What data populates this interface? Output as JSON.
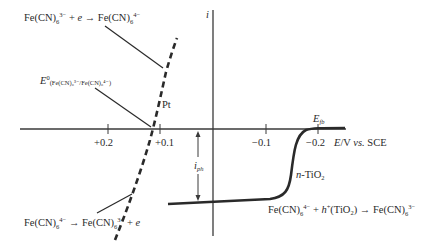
{
  "diagram": {
    "axes": {
      "y_label": "i",
      "x_label_italic": "E",
      "x_label_rest": "/V ",
      "x_label_vs": "vs.",
      "x_label_ref": " SCE",
      "ticks": [
        "+0.2",
        "+0.1",
        "−0.1",
        "−0.2"
      ],
      "flatband_label": "E",
      "flatband_sub": "fb"
    },
    "curves": {
      "pt": {
        "label": "Pt",
        "style": "dashed"
      },
      "tio2": {
        "label_italic": "n",
        "label_rest": "-TiO",
        "label_sub": "2",
        "style": "solid"
      }
    },
    "photocurrent": {
      "label": "i",
      "sub": "ph"
    },
    "annotations": {
      "reduction": {
        "lhs": "Fe(CN)",
        "lhs_sub": "6",
        "lhs_sup": "3−",
        "mid": " + ",
        "e": "e",
        "arrow": " → ",
        "rhs": "Fe(CN)",
        "rhs_sub": "6",
        "rhs_sup": "4−"
      },
      "standard_potential": {
        "E": "E",
        "sup": "0",
        "sub": "(Fe(CN)₆³⁻/Fe(CN)₆⁴⁻)"
      },
      "oxidation_pt": {
        "lhs": "Fe(CN)",
        "lhs_sub": "6",
        "lhs_sup": "4−",
        "arrow": " → ",
        "rhs": "Fe(CN)",
        "rhs_sub": "6",
        "rhs_sup": "3−",
        "tail": " + ",
        "e": "e"
      },
      "oxidation_tio2": {
        "lhs": "Fe(CN)",
        "lhs_sub": "6",
        "lhs_sup": "4−",
        "plus": " + ",
        "h": "h",
        "h_sup": "+",
        "mat": "(TiO",
        "mat_sub": "2",
        "mat_close": ")",
        "arrow": " → ",
        "rhs": "Fe(CN)",
        "rhs_sub": "6",
        "rhs_sup": "3−"
      }
    }
  }
}
